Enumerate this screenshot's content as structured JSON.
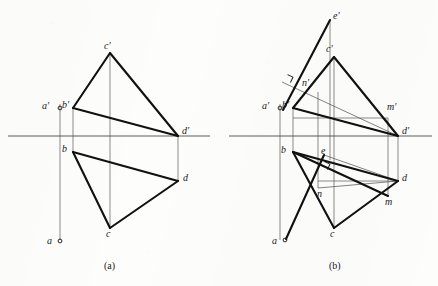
{
  "figure": {
    "stroke_color": "#111111",
    "thin_color": "#5a5a5a",
    "background_color": "#fdfdfc",
    "ground_line_color": "#4a4a4a"
  },
  "panels": [
    {
      "id": "a",
      "caption": "(a)",
      "caption_pos": {
        "x": 104,
        "y": 261
      },
      "ground_line": {
        "x1": 8,
        "y1": 136,
        "x2": 210,
        "y2": 136
      },
      "points": [
        {
          "name": "a-prime",
          "label": "a′",
          "x": 60,
          "y": 108,
          "lx": 42,
          "ly": 101,
          "marker": "circle"
        },
        {
          "name": "b-prime",
          "label": "b′",
          "x": 73,
          "y": 108,
          "lx": 62,
          "ly": 100,
          "marker": "none"
        },
        {
          "name": "c-prime",
          "label": "c′",
          "x": 110,
          "y": 53,
          "lx": 104,
          "ly": 41,
          "marker": "none"
        },
        {
          "name": "d-prime",
          "label": "d′",
          "x": 178,
          "y": 136,
          "lx": 182,
          "ly": 126,
          "marker": "none"
        },
        {
          "name": "a",
          "label": "a",
          "x": 60,
          "y": 241,
          "lx": 47,
          "ly": 236,
          "marker": "circle"
        },
        {
          "name": "b",
          "label": "b",
          "x": 73,
          "y": 152,
          "lx": 62,
          "ly": 144,
          "marker": "none"
        },
        {
          "name": "c",
          "label": "c",
          "x": 110,
          "y": 228,
          "lx": 106,
          "ly": 229,
          "marker": "none"
        },
        {
          "name": "d",
          "label": "d",
          "x": 178,
          "y": 181,
          "lx": 183,
          "ly": 173,
          "marker": "none"
        }
      ],
      "thick_edges": [
        {
          "name": "edge-bp-cp",
          "x1": 73,
          "y1": 108,
          "x2": 110,
          "y2": 53
        },
        {
          "name": "edge-cp-dp",
          "x1": 110,
          "y1": 53,
          "x2": 178,
          "y2": 136
        },
        {
          "name": "edge-bp-dp",
          "x1": 73,
          "y1": 108,
          "x2": 178,
          "y2": 136
        },
        {
          "name": "edge-b-c",
          "x1": 73,
          "y1": 152,
          "x2": 110,
          "y2": 228
        },
        {
          "name": "edge-c-d",
          "x1": 110,
          "y1": 228,
          "x2": 178,
          "y2": 181
        },
        {
          "name": "edge-b-d",
          "x1": 73,
          "y1": 152,
          "x2": 178,
          "y2": 181
        }
      ],
      "projector_lines": [
        {
          "name": "projector-a",
          "x1": 60,
          "y1": 104,
          "x2": 60,
          "y2": 240
        },
        {
          "name": "projector-b",
          "x1": 73,
          "y1": 108,
          "x2": 73,
          "y2": 152
        },
        {
          "name": "projector-c",
          "x1": 110,
          "y1": 53,
          "x2": 110,
          "y2": 228
        },
        {
          "name": "projector-d",
          "x1": 178,
          "y1": 136,
          "x2": 178,
          "y2": 181
        }
      ]
    },
    {
      "id": "b",
      "caption": "(b)",
      "caption_pos": {
        "x": 329,
        "y": 261
      },
      "ground_line": {
        "x1": 229,
        "y1": 136,
        "x2": 432,
        "y2": 136
      },
      "points": [
        {
          "name": "a-prime",
          "label": "a′",
          "x": 280,
          "y": 108,
          "lx": 262,
          "ly": 101,
          "marker": "circle"
        },
        {
          "name": "b-prime",
          "label": "b′",
          "x": 293,
          "y": 108,
          "lx": 282,
          "ly": 100,
          "marker": "none"
        },
        {
          "name": "c-prime",
          "label": "c′",
          "x": 334,
          "y": 57,
          "lx": 326,
          "ly": 44,
          "marker": "none"
        },
        {
          "name": "d-prime",
          "label": "d′",
          "x": 398,
          "y": 136,
          "lx": 402,
          "ly": 126,
          "marker": "none"
        },
        {
          "name": "e-prime",
          "label": "e′",
          "x": 330,
          "y": 20,
          "lx": 333,
          "ly": 11,
          "marker": "none"
        },
        {
          "name": "m-prime",
          "label": "m′",
          "x": 385,
          "y": 118,
          "lx": 387,
          "ly": 102,
          "marker": "none"
        },
        {
          "name": "n-prime",
          "label": "n′",
          "x": 310,
          "y": 87,
          "lx": 302,
          "ly": 78,
          "marker": "none"
        },
        {
          "name": "a",
          "label": "a",
          "x": 285,
          "y": 240,
          "lx": 272,
          "ly": 236,
          "marker": "circle"
        },
        {
          "name": "b",
          "label": "b",
          "x": 293,
          "y": 152,
          "lx": 281,
          "ly": 145,
          "marker": "none"
        },
        {
          "name": "c",
          "label": "c",
          "x": 334,
          "y": 228,
          "lx": 330,
          "ly": 229,
          "marker": "none"
        },
        {
          "name": "d",
          "label": "d",
          "x": 398,
          "y": 181,
          "lx": 402,
          "ly": 173,
          "marker": "none"
        },
        {
          "name": "e",
          "label": "e",
          "x": 324,
          "y": 155,
          "lx": 321,
          "ly": 146,
          "marker": "none"
        },
        {
          "name": "m",
          "label": "m",
          "x": 388,
          "y": 196,
          "lx": 385,
          "ly": 197,
          "marker": "none"
        },
        {
          "name": "n",
          "label": "n",
          "x": 318,
          "y": 188,
          "lx": 317,
          "ly": 189,
          "marker": "none"
        }
      ],
      "thick_edges": [
        {
          "name": "edge-bp-cp",
          "x1": 293,
          "y1": 108,
          "x2": 334,
          "y2": 57
        },
        {
          "name": "edge-cp-dp",
          "x1": 334,
          "y1": 57,
          "x2": 398,
          "y2": 136
        },
        {
          "name": "edge-bp-dp",
          "x1": 293,
          "y1": 108,
          "x2": 398,
          "y2": 136
        },
        {
          "name": "edge-ep-ap",
          "x1": 330,
          "y1": 20,
          "x2": 283,
          "y2": 110
        },
        {
          "name": "edge-b-c",
          "x1": 293,
          "y1": 152,
          "x2": 334,
          "y2": 228
        },
        {
          "name": "edge-c-d",
          "x1": 334,
          "y1": 228,
          "x2": 398,
          "y2": 181
        },
        {
          "name": "edge-b-d",
          "x1": 293,
          "y1": 152,
          "x2": 398,
          "y2": 181
        },
        {
          "name": "edge-e-a",
          "x1": 324,
          "y1": 155,
          "x2": 286,
          "y2": 239
        },
        {
          "name": "edge-b-e-m",
          "x1": 293,
          "y1": 152,
          "x2": 388,
          "y2": 196
        }
      ],
      "thin_edges": [
        {
          "name": "line-ep-mp",
          "x1": 282,
          "y1": 82,
          "x2": 398,
          "y2": 136
        },
        {
          "name": "line-np-dp",
          "x1": 293,
          "y1": 108,
          "x2": 398,
          "y2": 136
        },
        {
          "name": "line-mp-dp",
          "x1": 385,
          "y1": 118,
          "x2": 398,
          "y2": 136
        },
        {
          "name": "line-b-m",
          "x1": 293,
          "y1": 152,
          "x2": 388,
          "y2": 196
        },
        {
          "name": "line-e-d",
          "x1": 324,
          "y1": 155,
          "x2": 398,
          "y2": 181
        },
        {
          "name": "line-n-m",
          "x1": 318,
          "y1": 188,
          "x2": 398,
          "y2": 181
        }
      ],
      "projector_lines": [
        {
          "name": "projector-a",
          "x1": 280,
          "y1": 104,
          "x2": 280,
          "y2": 240
        },
        {
          "name": "projector-b",
          "x1": 293,
          "y1": 108,
          "x2": 293,
          "y2": 152
        },
        {
          "name": "projector-c",
          "x1": 334,
          "y1": 57,
          "x2": 334,
          "y2": 228
        },
        {
          "name": "projector-d",
          "x1": 398,
          "y1": 136,
          "x2": 398,
          "y2": 181
        },
        {
          "name": "projector-e",
          "x1": 330,
          "y1": 20,
          "x2": 330,
          "y2": 160
        },
        {
          "name": "projector-n",
          "x1": 318,
          "y1": 92,
          "x2": 318,
          "y2": 188
        },
        {
          "name": "projector-m",
          "x1": 388,
          "y1": 118,
          "x2": 388,
          "y2": 196
        },
        {
          "name": "connector-mp-bp",
          "x1": 293,
          "y1": 118,
          "x2": 388,
          "y2": 118
        },
        {
          "name": "connector-n-m",
          "x1": 318,
          "y1": 181,
          "x2": 398,
          "y2": 181
        }
      ],
      "right_angle_marks": [
        {
          "name": "right-angle-upper",
          "x": 285,
          "y": 80,
          "rotation": 25
        },
        {
          "name": "right-angle-lower",
          "x": 322,
          "y": 167,
          "rotation": 25
        }
      ]
    }
  ]
}
